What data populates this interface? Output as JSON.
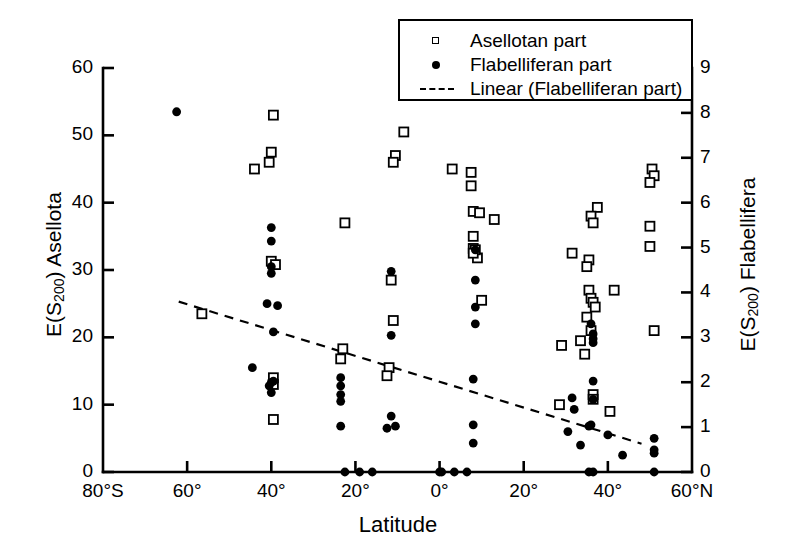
{
  "figure": {
    "xlabel": "Latitude",
    "ylabel_left_pre": "E(S",
    "ylabel_left_sub": "200",
    "ylabel_left_post": ") Asellota",
    "ylabel_right_pre": "E(S",
    "ylabel_right_sub": "200",
    "ylabel_right_post": ") Flabellifera"
  },
  "legend": {
    "items": [
      {
        "label": "Asellotan part",
        "symbol": "open-square",
        "color": "#000000"
      },
      {
        "label": "Flabelliferan part",
        "symbol": "filled-circle",
        "color": "#000000"
      },
      {
        "label": "Linear (Flabelliferan part)",
        "symbol": "dashed-line",
        "color": "#000000"
      }
    ]
  },
  "axes": {
    "x_ticklabels": [
      "80°S",
      "60°",
      "40°",
      "20°",
      "0°",
      "20°",
      "40°",
      "60°N"
    ],
    "x_tickvalues": [
      -80,
      -60,
      -40,
      -20,
      0,
      20,
      40,
      60
    ],
    "y_left_ticklabels": [
      "0",
      "10",
      "20",
      "30",
      "40",
      "50",
      "60"
    ],
    "y_left_tickvalues": [
      0,
      10,
      20,
      30,
      40,
      50,
      60
    ],
    "y_right_ticklabels": [
      "0",
      "1",
      "2",
      "3",
      "4",
      "5",
      "6",
      "7",
      "8",
      "9"
    ],
    "y_right_tickvalues": [
      0,
      1,
      2,
      3,
      4,
      5,
      6,
      7,
      8,
      9
    ],
    "xlim": [
      -80,
      60
    ],
    "ylim_left": [
      0,
      60
    ],
    "ylim_right": [
      0,
      9
    ],
    "grid": false
  },
  "chart_data": {
    "type": "scatter",
    "title": "",
    "xlabel": "Latitude",
    "ylabel": "E(S200) Asellota",
    "ylabel_secondary": "E(S200) Flabellifera",
    "xlim": [
      -80,
      60
    ],
    "ylim": [
      0,
      60
    ],
    "ylim_secondary": [
      0,
      9
    ],
    "legend_position": "top-center",
    "grid": false,
    "series": [
      {
        "name": "Asellotan part",
        "marker": "open-square",
        "axis": "left",
        "points": [
          [
            -44.0,
            45.0
          ],
          [
            -39.5,
            53.0
          ],
          [
            -40.0,
            47.5
          ],
          [
            -40.5,
            46.0
          ],
          [
            -40.0,
            31.3
          ],
          [
            -39.0,
            30.8
          ],
          [
            -39.5,
            14.0
          ],
          [
            -39.5,
            13.0
          ],
          [
            -39.5,
            7.8
          ],
          [
            -56.5,
            23.5
          ],
          [
            -23.0,
            18.3
          ],
          [
            -23.5,
            16.8
          ],
          [
            -22.5,
            37.0
          ],
          [
            -10.5,
            47.0
          ],
          [
            -11.0,
            46.0
          ],
          [
            -8.5,
            50.5
          ],
          [
            -11.5,
            28.5
          ],
          [
            -11.0,
            22.5
          ],
          [
            -12.0,
            15.5
          ],
          [
            -12.5,
            14.3
          ],
          [
            3.0,
            45.0
          ],
          [
            7.5,
            44.5
          ],
          [
            7.5,
            42.5
          ],
          [
            8.0,
            38.7
          ],
          [
            9.5,
            38.5
          ],
          [
            13.0,
            37.5
          ],
          [
            8.0,
            35.0
          ],
          [
            8.0,
            33.2
          ],
          [
            9.0,
            31.8
          ],
          [
            8.5,
            33.0
          ],
          [
            8.0,
            32.5
          ],
          [
            10.0,
            25.5
          ],
          [
            31.5,
            32.5
          ],
          [
            37.5,
            39.3
          ],
          [
            36.0,
            38.0
          ],
          [
            36.5,
            37.0
          ],
          [
            35.5,
            31.5
          ],
          [
            35.0,
            30.5
          ],
          [
            35.5,
            27.0
          ],
          [
            36.0,
            25.8
          ],
          [
            36.5,
            25.2
          ],
          [
            37.0,
            24.5
          ],
          [
            35.0,
            23.0
          ],
          [
            33.5,
            19.5
          ],
          [
            34.5,
            17.5
          ],
          [
            29.0,
            18.8
          ],
          [
            41.5,
            27.0
          ],
          [
            36.0,
            21.0
          ],
          [
            36.5,
            11.5
          ],
          [
            36.5,
            10.8
          ],
          [
            40.5,
            9.0
          ],
          [
            28.5,
            10.0
          ],
          [
            50.5,
            45.0
          ],
          [
            51.0,
            44.0
          ],
          [
            50.0,
            43.0
          ],
          [
            50.0,
            36.5
          ],
          [
            50.0,
            33.5
          ],
          [
            51.0,
            21.0
          ]
        ]
      },
      {
        "name": "Flabelliferan part",
        "marker": "filled-circle",
        "axis": "left",
        "points": [
          [
            -62.5,
            53.5
          ],
          [
            -40.0,
            36.3
          ],
          [
            -40.0,
            34.3
          ],
          [
            -40.0,
            30.5
          ],
          [
            -40.0,
            29.5
          ],
          [
            -41.0,
            25.0
          ],
          [
            -38.5,
            24.7
          ],
          [
            -39.5,
            20.8
          ],
          [
            -44.5,
            15.5
          ],
          [
            -40.0,
            13.3
          ],
          [
            -40.5,
            12.8
          ],
          [
            -39.5,
            13.5
          ],
          [
            -40.0,
            11.8
          ],
          [
            -23.5,
            14.0
          ],
          [
            -23.5,
            12.8
          ],
          [
            -23.5,
            11.5
          ],
          [
            -23.5,
            10.5
          ],
          [
            -23.5,
            6.8
          ],
          [
            -11.5,
            29.8
          ],
          [
            -11.5,
            20.3
          ],
          [
            -11.5,
            8.3
          ],
          [
            -12.5,
            6.5
          ],
          [
            -10.5,
            6.8
          ],
          [
            0.0,
            0.0
          ],
          [
            8.5,
            33.0
          ],
          [
            8.5,
            28.5
          ],
          [
            8.5,
            24.5
          ],
          [
            8.5,
            22.0
          ],
          [
            8.0,
            13.8
          ],
          [
            8.0,
            7.0
          ],
          [
            8.0,
            4.3
          ],
          [
            36.0,
            22.0
          ],
          [
            36.5,
            20.5
          ],
          [
            36.5,
            19.8
          ],
          [
            36.5,
            19.2
          ],
          [
            36.5,
            13.5
          ],
          [
            36.5,
            10.8
          ],
          [
            36.0,
            7.0
          ],
          [
            35.5,
            6.8
          ],
          [
            31.5,
            11.0
          ],
          [
            32.0,
            9.3
          ],
          [
            30.5,
            6.0
          ],
          [
            33.5,
            4.0
          ],
          [
            40.0,
            5.5
          ],
          [
            43.5,
            2.5
          ],
          [
            51.0,
            5.0
          ],
          [
            51.0,
            3.3
          ],
          [
            51.0,
            2.8
          ],
          [
            -22.5,
            0.0
          ],
          [
            -19.0,
            0.0
          ],
          [
            -16.0,
            0.0
          ],
          [
            0.5,
            0.0
          ],
          [
            3.5,
            0.0
          ],
          [
            6.5,
            0.0
          ],
          [
            35.5,
            0.0
          ],
          [
            36.5,
            0.0
          ],
          [
            51.0,
            0.0
          ]
        ]
      }
    ],
    "trendline": {
      "name": "Linear (Flabelliferan part)",
      "style": "dashed",
      "x_start": -62.0,
      "y_start": 25.3,
      "x_end": 48.0,
      "y_end": 4.2
    }
  }
}
